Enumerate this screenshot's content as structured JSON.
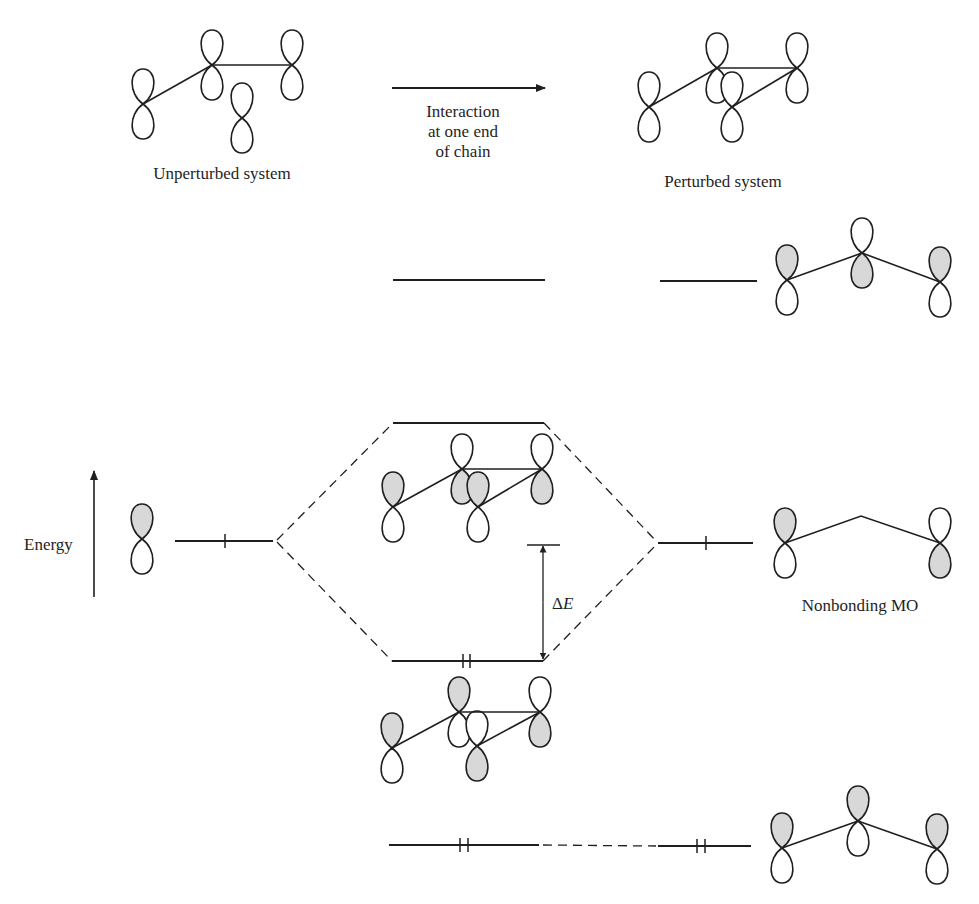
{
  "figure": {
    "labels": {
      "unperturbed": "Unperturbed system",
      "perturbed": "Perturbed system",
      "interaction": [
        "Interaction",
        "at one end",
        "of chain"
      ],
      "energy": "Energy",
      "delta_symbol": "Δ",
      "delta_var": "E",
      "nonbonding": "Nonbonding MO"
    },
    "colors": {
      "ink": "#1f1f1f",
      "shade": "#d8d8d8",
      "lobe_fill": "#ffffff",
      "background": "#ffffff"
    },
    "orbital_groups": [
      {
        "name": "unperturbed-system-orbitals",
        "nodes": [
          {
            "x": 143,
            "y": 104,
            "top": false,
            "bottom": false
          },
          {
            "x": 212,
            "y": 65,
            "top": false,
            "bottom": false
          },
          {
            "x": 292,
            "y": 65,
            "top": false,
            "bottom": false
          },
          {
            "x": 242,
            "y": 118,
            "top": false,
            "bottom": false
          }
        ],
        "bonds": [
          [
            0,
            1
          ],
          [
            1,
            2
          ]
        ]
      },
      {
        "name": "perturbed-system-orbitals",
        "nodes": [
          {
            "x": 649,
            "y": 107,
            "top": false,
            "bottom": false
          },
          {
            "x": 717,
            "y": 68,
            "top": false,
            "bottom": false
          },
          {
            "x": 797,
            "y": 68,
            "top": false,
            "bottom": false
          },
          {
            "x": 732,
            "y": 107,
            "top": false,
            "bottom": false
          }
        ],
        "bonds": [
          [
            0,
            1
          ],
          [
            1,
            2
          ],
          [
            3,
            2
          ]
        ]
      },
      {
        "name": "allyl-antibonding-mo",
        "nodes": [
          {
            "x": 787,
            "y": 280,
            "top": true,
            "bottom": false
          },
          {
            "x": 862,
            "y": 253,
            "top": false,
            "bottom": true
          },
          {
            "x": 940,
            "y": 282,
            "top": true,
            "bottom": false
          }
        ],
        "bonds": [
          [
            0,
            1
          ],
          [
            1,
            2
          ]
        ]
      },
      {
        "name": "perturbed-antibonding-mo",
        "nodes": [
          {
            "x": 393,
            "y": 507,
            "top": true,
            "bottom": false
          },
          {
            "x": 462,
            "y": 469,
            "top": false,
            "bottom": true
          },
          {
            "x": 542,
            "y": 469,
            "top": false,
            "bottom": true
          },
          {
            "x": 478,
            "y": 507,
            "top": true,
            "bottom": false
          }
        ],
        "bonds": [
          [
            0,
            1
          ],
          [
            1,
            2
          ],
          [
            3,
            2
          ]
        ]
      },
      {
        "name": "single-p-orbital",
        "nodes": [
          {
            "x": 142,
            "y": 539,
            "top": true,
            "bottom": false
          }
        ],
        "bonds": []
      },
      {
        "name": "nonbonding-mo",
        "nodes": [
          {
            "x": 785,
            "y": 543,
            "top": true,
            "bottom": false
          },
          {
            "x": 940,
            "y": 543,
            "top": false,
            "bottom": true
          }
        ],
        "bonds": [],
        "skeleton": [
          [
            785,
            543
          ],
          [
            861,
            516
          ],
          [
            940,
            543
          ]
        ]
      },
      {
        "name": "perturbed-bonding-mo",
        "nodes": [
          {
            "x": 392,
            "y": 748,
            "top": true,
            "bottom": false
          },
          {
            "x": 459,
            "y": 712,
            "top": true,
            "bottom": false
          },
          {
            "x": 540,
            "y": 712,
            "top": false,
            "bottom": true
          },
          {
            "x": 477,
            "y": 746,
            "top": false,
            "bottom": true
          }
        ],
        "bonds": [
          [
            0,
            1
          ],
          [
            1,
            2
          ],
          [
            3,
            2
          ]
        ]
      },
      {
        "name": "allyl-bonding-mo",
        "nodes": [
          {
            "x": 782,
            "y": 848,
            "top": true,
            "bottom": false
          },
          {
            "x": 858,
            "y": 821,
            "top": true,
            "bottom": false
          },
          {
            "x": 937,
            "y": 849,
            "top": true,
            "bottom": false
          }
        ],
        "bonds": [
          [
            0,
            1
          ],
          [
            1,
            2
          ]
        ]
      }
    ],
    "energy_levels": [
      {
        "name": "unperturbed-upper-level",
        "x1": 393,
        "x2": 545,
        "y": 280,
        "electrons": []
      },
      {
        "name": "perturbed-upper-level",
        "x1": 660,
        "x2": 757,
        "y": 281,
        "electrons": []
      },
      {
        "name": "antibonding-level",
        "x1": 393,
        "x2": 544,
        "y": 423,
        "electrons": []
      },
      {
        "name": "p-orbital-level",
        "x1": 175,
        "x2": 273,
        "y": 541,
        "electrons": [
          225
        ]
      },
      {
        "name": "nonbonding-level",
        "x1": 658,
        "x2": 753,
        "y": 543,
        "electrons": [
          706
        ]
      },
      {
        "name": "bonding-level",
        "x1": 392,
        "x2": 543,
        "y": 661,
        "electrons": [
          463,
          470
        ]
      },
      {
        "name": "unperturbed-lower-level",
        "x1": 389,
        "x2": 539,
        "y": 845,
        "electrons": [
          460,
          468
        ]
      },
      {
        "name": "perturbed-lower-level",
        "x1": 658,
        "x2": 751,
        "y": 846,
        "electrons": [
          697,
          705
        ]
      }
    ],
    "correlation_lines": [
      {
        "name": "p-to-antibonding",
        "x1": 277,
        "y1": 540,
        "x2": 393,
        "y2": 423
      },
      {
        "name": "p-to-bonding",
        "x1": 277,
        "y1": 542,
        "x2": 392,
        "y2": 661
      },
      {
        "name": "antibonding-to-nonbonding",
        "x1": 544,
        "y1": 423,
        "x2": 657,
        "y2": 542
      },
      {
        "name": "bonding-to-nonbonding",
        "x1": 543,
        "y1": 661,
        "x2": 657,
        "y2": 544
      },
      {
        "name": "lower-level-correlation",
        "x1": 543,
        "y1": 845,
        "x2": 656,
        "y2": 846
      }
    ],
    "arrows": {
      "interaction": {
        "x1": 392,
        "y1": 88,
        "x2": 545,
        "y2": 88
      },
      "energy": {
        "x": 94,
        "y_bottom": 597,
        "y_top": 471
      },
      "delta_e": {
        "x": 543,
        "y_top": 545,
        "y_bottom": 660,
        "bar_x1": 527,
        "bar_x2": 560
      }
    }
  }
}
